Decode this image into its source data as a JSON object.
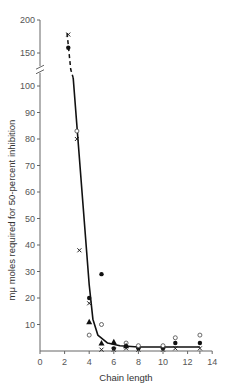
{
  "chart_data": {
    "type": "scatter",
    "title": "",
    "xlabel": "Chain length",
    "ylabel": "mμ moles required for 50-percent inhibition",
    "xlim": [
      0,
      14
    ],
    "ylim": [
      0,
      200
    ],
    "y_axis_break": [
      105,
      125
    ],
    "x_ticks": [
      0,
      2,
      4,
      6,
      8,
      10,
      12,
      14
    ],
    "y_ticks_lower": [
      10,
      20,
      30,
      40,
      50,
      60,
      70,
      80,
      90,
      100
    ],
    "y_ticks_upper": [
      150,
      200
    ],
    "grid": false,
    "legend": null,
    "series": [
      {
        "name": "filled-circle",
        "marker": "filled circle",
        "points": [
          [
            2.3,
            158
          ],
          [
            4,
            20
          ],
          [
            5,
            29
          ],
          [
            6,
            1
          ],
          [
            7,
            2
          ],
          [
            8,
            1
          ],
          [
            10,
            1
          ],
          [
            11,
            3
          ],
          [
            13,
            3
          ]
        ]
      },
      {
        "name": "open-circle",
        "marker": "open circle",
        "points": [
          [
            3,
            83
          ],
          [
            4,
            6
          ],
          [
            5,
            10
          ],
          [
            7,
            3
          ],
          [
            8,
            2
          ],
          [
            10,
            2
          ],
          [
            11,
            5
          ],
          [
            13,
            6
          ]
        ]
      },
      {
        "name": "cross",
        "marker": "x",
        "points": [
          [
            2.3,
            178
          ],
          [
            3,
            80
          ],
          [
            3.2,
            38
          ],
          [
            4,
            18
          ],
          [
            5,
            0.5
          ],
          [
            6,
            0.5
          ],
          [
            7,
            1
          ],
          [
            8,
            0.5
          ],
          [
            10,
            0.5
          ],
          [
            11,
            1
          ],
          [
            13,
            1
          ]
        ]
      },
      {
        "name": "filled-triangle",
        "marker": "filled triangle",
        "points": [
          [
            4,
            11
          ],
          [
            5,
            3
          ],
          [
            6,
            3.5
          ],
          [
            7,
            2
          ]
        ]
      }
    ],
    "fit_curve": {
      "style": "solid (dashed above axis break)",
      "points": [
        [
          2.2,
          180
        ],
        [
          2.5,
          125
        ],
        [
          2.7,
          103
        ],
        [
          3,
          85
        ],
        [
          3.5,
          55
        ],
        [
          4,
          25
        ],
        [
          4.3,
          12
        ],
        [
          4.7,
          6
        ],
        [
          5.5,
          3
        ],
        [
          6.5,
          2
        ],
        [
          8,
          1.5
        ],
        [
          13,
          1.5
        ]
      ]
    }
  }
}
